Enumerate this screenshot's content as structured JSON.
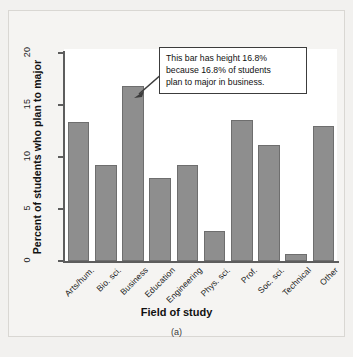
{
  "chart_data": {
    "type": "bar",
    "title": "",
    "xlabel": "Field of study",
    "ylabel": "Percent of students who plan to major",
    "categories": [
      "Arts/hum.",
      "Bio. sci.",
      "Business",
      "Education",
      "Engineering",
      "Phys. sci.",
      "Prof.",
      "Soc. sci.",
      "Technical",
      "Other"
    ],
    "values": [
      13.4,
      9.2,
      16.8,
      8.0,
      9.2,
      2.9,
      13.6,
      11.2,
      0.7,
      13.0
    ],
    "ylim": [
      0,
      20
    ],
    "yticks": [
      0,
      5,
      10,
      15,
      20
    ],
    "ytick_labels": [
      "0",
      "5",
      "10",
      "15",
      "20"
    ],
    "grid": false,
    "legend": false,
    "bar_color": "#8e8e8e",
    "bar_edge_color": "#6e6e6e",
    "annotations": [
      {
        "target_category": "Business",
        "lines": [
          "This bar has height 16.8%",
          "because 16.8% of students",
          "plan to major in business."
        ]
      }
    ]
  },
  "caption": "(a)"
}
